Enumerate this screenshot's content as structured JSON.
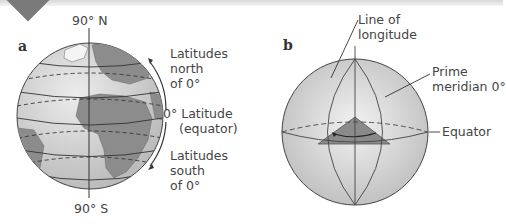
{
  "figure": {
    "panels": [
      {
        "letter": "a",
        "labels": {
          "north_pole": "90° N",
          "south_pole": "90° S",
          "north_lat": [
            "Latitudes",
            "north",
            "of 0°"
          ],
          "equator_main": "0° Latitude",
          "equator_sub": "(equator)",
          "south_lat": [
            "Latitudes",
            "south",
            "of 0°"
          ]
        }
      },
      {
        "letter": "b",
        "labels": {
          "longitude": [
            "Line of",
            "longitude"
          ],
          "prime_meridian": [
            "Prime",
            "meridian 0°"
          ],
          "equator": "Equator"
        }
      }
    ],
    "colors": {
      "globe_fill": "#d9d9d9",
      "land": "#8c8c8c",
      "lines": "#555555",
      "wedge": "#8a8a8a",
      "corner_marker": "#7a7a7a"
    }
  }
}
